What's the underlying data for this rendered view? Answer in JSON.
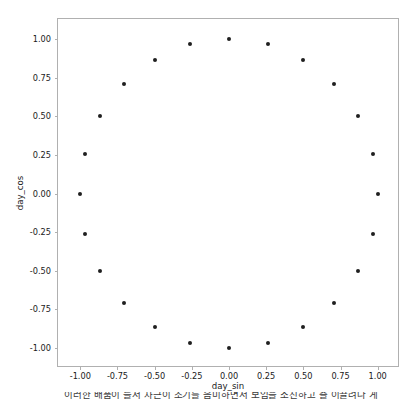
{
  "figure": {
    "background_color": "#ffffff",
    "axes_edge_color": "#b0b0b0",
    "marker_color": "#1f1f1f"
  },
  "chart_data": {
    "type": "scatter",
    "title": "",
    "xlabel": "day_sin",
    "ylabel": "day_cos",
    "xlim": [
      -1.15,
      1.15
    ],
    "ylim": [
      -1.13,
      1.13
    ],
    "grid": false,
    "legend": null,
    "marker": "circle",
    "marker_size": 4,
    "n_points": 24,
    "xticks": [
      -1.0,
      -0.75,
      -0.5,
      -0.25,
      0.0,
      0.25,
      0.5,
      0.75,
      1.0
    ],
    "xticklabels": [
      "-1.00",
      "-0.75",
      "-0.50",
      "-0.25",
      "0.00",
      "0.25",
      "0.50",
      "0.75",
      "1.00"
    ],
    "yticks": [
      1.0,
      0.75,
      0.5,
      0.25,
      0.0,
      -0.25,
      -0.5,
      -0.75,
      -1.0
    ],
    "yticklabels": [
      "1.00",
      "0.75",
      "0.50",
      "0.25",
      "0.00",
      "-0.25",
      "-0.50",
      "-0.75",
      "-1.00"
    ],
    "x": [
      0.0,
      0.259,
      0.5,
      0.707,
      0.866,
      0.966,
      1.0,
      0.966,
      0.866,
      0.707,
      0.5,
      0.259,
      0.0,
      -0.259,
      -0.5,
      -0.707,
      -0.866,
      -0.966,
      -1.0,
      -0.966,
      -0.866,
      -0.707,
      -0.5,
      -0.259
    ],
    "y": [
      1.0,
      0.966,
      0.866,
      0.707,
      0.5,
      0.259,
      0.0,
      -0.259,
      -0.5,
      -0.707,
      -0.866,
      -0.966,
      -1.0,
      -0.966,
      -0.866,
      -0.707,
      -0.5,
      -0.259,
      0.0,
      0.259,
      0.5,
      0.707,
      0.866,
      0.966
    ]
  },
  "caption": {
    "lead": "",
    "text": "이러한 배품이 들서 차근이 조기를 음미하면서 보임을 소진하고 즐 이끌려나 게"
  }
}
